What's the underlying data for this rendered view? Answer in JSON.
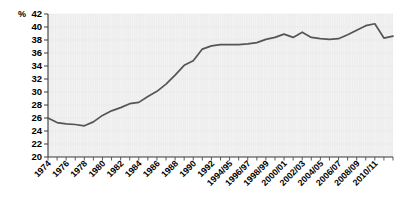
{
  "chart_data": {
    "type": "line",
    "title": "",
    "xlabel": "",
    "ylabel": "%",
    "ylim": [
      20,
      42
    ],
    "ytick_step": 2,
    "yticks": [
      20,
      22,
      24,
      26,
      28,
      30,
      32,
      34,
      36,
      38,
      40,
      42
    ],
    "ytick_labels": [
      "20",
      "22",
      "24",
      "26",
      "28",
      "30",
      "32",
      "34",
      "36",
      "38",
      "40",
      "42"
    ],
    "grid": true,
    "legend": "none",
    "line_color": "#555555",
    "plot_background": "#ededed",
    "axis_color": "#3a3a3a",
    "categories": [
      "1974",
      "1975",
      "1976",
      "1977",
      "1978",
      "1979",
      "1980",
      "1981",
      "1982",
      "1983",
      "1984",
      "1985",
      "1986",
      "1987",
      "1988",
      "1989",
      "1990",
      "1991",
      "1992",
      "1993/94",
      "1994/95",
      "1995/96",
      "1996/97",
      "1997/98",
      "1998/99",
      "1999/2000",
      "2000/01",
      "2001/02",
      "2002/03",
      "2003/04",
      "2004/05",
      "2005/06",
      "2006/07",
      "2007/08",
      "2008/09",
      "2009/10",
      "2010/11",
      "2011/12",
      "2012/13"
    ],
    "xtick_labels": [
      "1974",
      "1976",
      "1978",
      "1980",
      "1982",
      "1984",
      "1986",
      "1988",
      "1990",
      "1992",
      "1994/95",
      "1996/97",
      "1998/99",
      "2000/01",
      "2002/03",
      "2004/05",
      "2006/07",
      "2008/09",
      "2010/11"
    ],
    "values": [
      26.0,
      25.3,
      25.1,
      25.0,
      24.8,
      25.4,
      26.4,
      27.1,
      27.6,
      28.2,
      28.4,
      29.3,
      30.1,
      31.2,
      32.6,
      34.1,
      34.8,
      36.6,
      37.1,
      37.3,
      37.3,
      37.3,
      37.4,
      37.6,
      38.1,
      38.4,
      38.9,
      38.4,
      39.2,
      38.4,
      38.2,
      38.1,
      38.2,
      38.8,
      39.5,
      40.2,
      40.5,
      38.3,
      38.6
    ]
  }
}
